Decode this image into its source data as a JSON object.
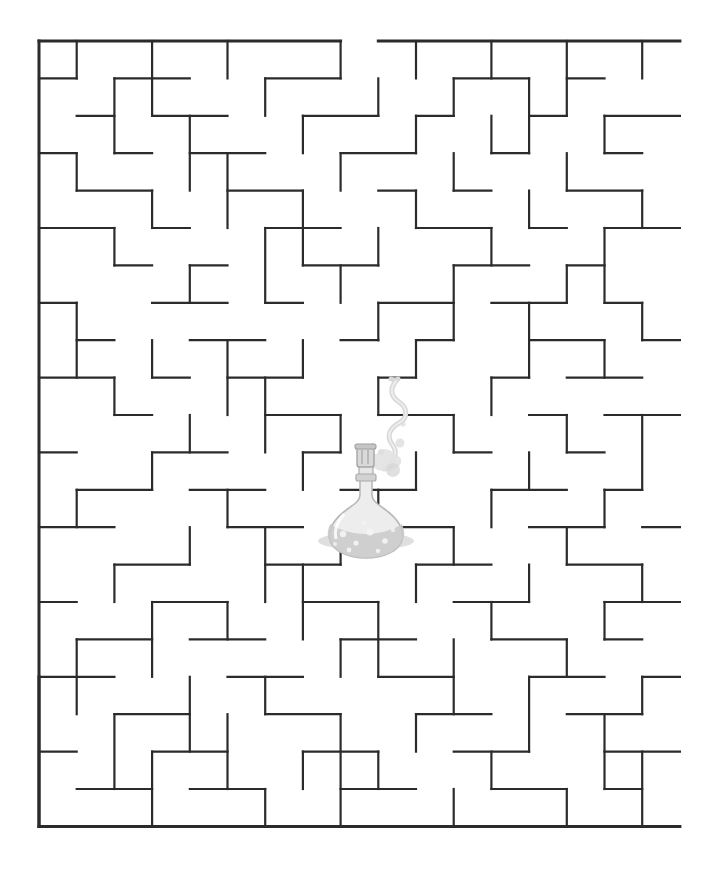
{
  "page": {
    "background_color": "#ffffff",
    "width": 715,
    "height": 869
  },
  "maze": {
    "name": "rectangular-maze",
    "wall_color": "#2b2b2b",
    "wall_thickness": 2.2,
    "border_thickness": 3,
    "origin_x": 39,
    "origin_y": 41,
    "cols": 17,
    "rows": 21,
    "cell_w": 37.7,
    "cell_h": 37.4,
    "entrance": {
      "side": "top",
      "start_col": 8,
      "end_col": 9
    },
    "exit": {
      "side": "none",
      "note": "center goal"
    },
    "goal": "flask at center",
    "h_walls": [
      [
        0,
        0,
        8
      ],
      [
        0,
        9,
        17
      ],
      [
        1,
        0,
        1
      ],
      [
        1,
        2,
        4
      ],
      [
        1,
        6,
        8
      ],
      [
        1,
        11,
        13
      ],
      [
        1,
        14,
        15
      ],
      [
        2,
        1,
        2
      ],
      [
        2,
        3,
        5
      ],
      [
        2,
        7,
        9
      ],
      [
        2,
        10,
        11
      ],
      [
        2,
        13,
        14
      ],
      [
        2,
        15,
        17
      ],
      [
        3,
        0,
        1
      ],
      [
        3,
        2,
        3
      ],
      [
        3,
        4,
        6
      ],
      [
        3,
        8,
        10
      ],
      [
        3,
        12,
        13
      ],
      [
        3,
        15,
        16
      ],
      [
        4,
        1,
        3
      ],
      [
        4,
        5,
        7
      ],
      [
        4,
        9,
        10
      ],
      [
        4,
        11,
        12
      ],
      [
        4,
        14,
        16
      ],
      [
        5,
        0,
        2
      ],
      [
        5,
        3,
        4
      ],
      [
        5,
        6,
        8
      ],
      [
        5,
        10,
        12
      ],
      [
        5,
        13,
        14
      ],
      [
        5,
        15,
        17
      ],
      [
        6,
        2,
        3
      ],
      [
        6,
        4,
        5
      ],
      [
        6,
        7,
        9
      ],
      [
        6,
        11,
        13
      ],
      [
        6,
        14,
        15
      ],
      [
        7,
        0,
        1
      ],
      [
        7,
        3,
        5
      ],
      [
        7,
        6,
        7
      ],
      [
        7,
        9,
        11
      ],
      [
        7,
        12,
        14
      ],
      [
        7,
        15,
        16
      ],
      [
        8,
        1,
        2
      ],
      [
        8,
        4,
        6
      ],
      [
        8,
        8,
        9
      ],
      [
        8,
        10,
        11
      ],
      [
        8,
        13,
        15
      ],
      [
        8,
        16,
        17
      ],
      [
        9,
        0,
        2
      ],
      [
        9,
        3,
        4
      ],
      [
        9,
        5,
        7
      ],
      [
        9,
        9,
        10
      ],
      [
        9,
        12,
        13
      ],
      [
        9,
        14,
        16
      ],
      [
        10,
        2,
        3
      ],
      [
        10,
        6,
        8
      ],
      [
        10,
        9,
        11
      ],
      [
        10,
        13,
        14
      ],
      [
        10,
        15,
        17
      ],
      [
        11,
        0,
        1
      ],
      [
        11,
        3,
        5
      ],
      [
        11,
        7,
        8
      ],
      [
        11,
        11,
        12
      ],
      [
        11,
        14,
        15
      ],
      [
        12,
        1,
        3
      ],
      [
        12,
        4,
        6
      ],
      [
        12,
        8,
        10
      ],
      [
        12,
        12,
        14
      ],
      [
        12,
        15,
        16
      ],
      [
        13,
        0,
        2
      ],
      [
        13,
        5,
        7
      ],
      [
        13,
        9,
        11
      ],
      [
        13,
        13,
        15
      ],
      [
        13,
        16,
        17
      ],
      [
        14,
        2,
        4
      ],
      [
        14,
        6,
        8
      ],
      [
        14,
        10,
        12
      ],
      [
        14,
        14,
        16
      ],
      [
        15,
        0,
        1
      ],
      [
        15,
        3,
        5
      ],
      [
        15,
        7,
        9
      ],
      [
        15,
        11,
        13
      ],
      [
        15,
        15,
        17
      ],
      [
        16,
        1,
        3
      ],
      [
        16,
        4,
        6
      ],
      [
        16,
        8,
        10
      ],
      [
        16,
        12,
        14
      ],
      [
        16,
        15,
        16
      ],
      [
        17,
        0,
        2
      ],
      [
        17,
        5,
        7
      ],
      [
        17,
        9,
        11
      ],
      [
        17,
        13,
        15
      ],
      [
        17,
        16,
        17
      ],
      [
        18,
        2,
        4
      ],
      [
        18,
        6,
        8
      ],
      [
        18,
        10,
        12
      ],
      [
        18,
        14,
        16
      ],
      [
        19,
        0,
        1
      ],
      [
        19,
        3,
        5
      ],
      [
        19,
        7,
        9
      ],
      [
        19,
        11,
        13
      ],
      [
        19,
        15,
        17
      ],
      [
        20,
        1,
        3
      ],
      [
        20,
        4,
        6
      ],
      [
        20,
        8,
        10
      ],
      [
        20,
        12,
        14
      ],
      [
        20,
        15,
        16
      ],
      [
        21,
        0,
        17
      ]
    ],
    "v_walls": [
      [
        0,
        0,
        21
      ],
      [
        0,
        17,
        21
      ],
      [
        1,
        0,
        1
      ],
      [
        1,
        3,
        4
      ],
      [
        1,
        7,
        9
      ],
      [
        1,
        12,
        13
      ],
      [
        1,
        16,
        18
      ],
      [
        2,
        1,
        3
      ],
      [
        2,
        5,
        6
      ],
      [
        2,
        9,
        10
      ],
      [
        2,
        14,
        15
      ],
      [
        2,
        18,
        20
      ],
      [
        3,
        0,
        2
      ],
      [
        3,
        4,
        5
      ],
      [
        3,
        8,
        9
      ],
      [
        3,
        11,
        12
      ],
      [
        3,
        15,
        17
      ],
      [
        3,
        19,
        21
      ],
      [
        4,
        2,
        4
      ],
      [
        4,
        6,
        7
      ],
      [
        4,
        10,
        11
      ],
      [
        4,
        13,
        14
      ],
      [
        4,
        17,
        19
      ],
      [
        5,
        0,
        1
      ],
      [
        5,
        3,
        5
      ],
      [
        5,
        8,
        10
      ],
      [
        5,
        12,
        13
      ],
      [
        5,
        15,
        16
      ],
      [
        5,
        18,
        20
      ],
      [
        6,
        1,
        2
      ],
      [
        6,
        5,
        7
      ],
      [
        6,
        9,
        11
      ],
      [
        6,
        13,
        15
      ],
      [
        6,
        17,
        18
      ],
      [
        6,
        20,
        21
      ],
      [
        7,
        2,
        3
      ],
      [
        7,
        4,
        6
      ],
      [
        7,
        8,
        9
      ],
      [
        7,
        11,
        12
      ],
      [
        7,
        14,
        16
      ],
      [
        7,
        19,
        20
      ],
      [
        8,
        0,
        1
      ],
      [
        8,
        3,
        4
      ],
      [
        8,
        6,
        7
      ],
      [
        8,
        10,
        11
      ],
      [
        8,
        13,
        14
      ],
      [
        8,
        16,
        17
      ],
      [
        8,
        18,
        21
      ],
      [
        9,
        1,
        2
      ],
      [
        9,
        5,
        6
      ],
      [
        9,
        7,
        8
      ],
      [
        9,
        9,
        10
      ],
      [
        9,
        12,
        13
      ],
      [
        9,
        15,
        17
      ],
      [
        9,
        19,
        20
      ],
      [
        10,
        0,
        1
      ],
      [
        10,
        2,
        3
      ],
      [
        10,
        4,
        5
      ],
      [
        10,
        8,
        9
      ],
      [
        10,
        11,
        12
      ],
      [
        10,
        14,
        15
      ],
      [
        10,
        18,
        19
      ],
      [
        11,
        1,
        2
      ],
      [
        11,
        3,
        4
      ],
      [
        11,
        6,
        8
      ],
      [
        11,
        10,
        11
      ],
      [
        11,
        13,
        14
      ],
      [
        11,
        16,
        18
      ],
      [
        11,
        20,
        21
      ],
      [
        12,
        0,
        1
      ],
      [
        12,
        2,
        3
      ],
      [
        12,
        5,
        6
      ],
      [
        12,
        9,
        10
      ],
      [
        12,
        12,
        13
      ],
      [
        12,
        15,
        16
      ],
      [
        12,
        19,
        20
      ],
      [
        13,
        1,
        3
      ],
      [
        13,
        4,
        5
      ],
      [
        13,
        7,
        9
      ],
      [
        13,
        11,
        12
      ],
      [
        13,
        14,
        15
      ],
      [
        13,
        17,
        19
      ],
      [
        14,
        0,
        2
      ],
      [
        14,
        3,
        4
      ],
      [
        14,
        6,
        7
      ],
      [
        14,
        10,
        11
      ],
      [
        14,
        13,
        14
      ],
      [
        14,
        16,
        17
      ],
      [
        14,
        20,
        21
      ],
      [
        15,
        2,
        3
      ],
      [
        15,
        5,
        7
      ],
      [
        15,
        8,
        9
      ],
      [
        15,
        12,
        13
      ],
      [
        15,
        15,
        16
      ],
      [
        15,
        18,
        20
      ],
      [
        16,
        0,
        1
      ],
      [
        16,
        4,
        5
      ],
      [
        16,
        7,
        8
      ],
      [
        16,
        10,
        12
      ],
      [
        16,
        14,
        15
      ],
      [
        16,
        17,
        18
      ],
      [
        16,
        19,
        21
      ]
    ]
  },
  "illustration": {
    "name": "chemistry-flask",
    "label": "round bottom flask with stopper, bubbling liquid and rising vapor",
    "center_x": 365,
    "center_y": 490,
    "colors": {
      "glass": "#cfcfcf",
      "glass_fill": "#e4e4e4",
      "liquid": "#c3c3c3",
      "bubble": "#f2f2f2",
      "smoke": "#dcdcdc",
      "shadow": "#b5b5b5",
      "stopper": "#b8b8b8"
    },
    "parts": [
      "stopper",
      "neck",
      "bulb",
      "liquid",
      "bubbles",
      "vapor-trail",
      "vapor-dots",
      "ground-shadow"
    ]
  }
}
